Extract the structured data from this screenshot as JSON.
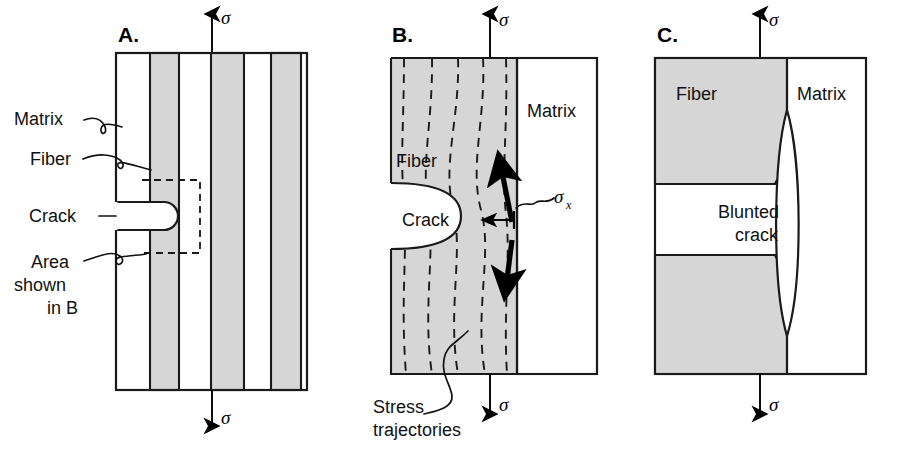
{
  "figure": {
    "background_color": "#ffffff",
    "fiber_color": "#d6d6d6",
    "matrix_color": "#ffffff",
    "line_color": "#1a1a1a"
  },
  "panels": [
    {
      "id": "A",
      "letter": "A.",
      "stress_top_label": "σ",
      "stress_bottom_label": "σ",
      "labels": [
        {
          "key": "matrix",
          "text": "Matrix"
        },
        {
          "key": "fiber",
          "text": "Fiber"
        },
        {
          "key": "crack",
          "text": "Crack"
        },
        {
          "key": "area_line1",
          "text": "Area"
        },
        {
          "key": "area_line2",
          "text": "shown"
        },
        {
          "key": "area_line3",
          "text": "in B"
        }
      ]
    },
    {
      "id": "B",
      "letter": "B.",
      "stress_top_label": "σ",
      "stress_bottom_label": "σ",
      "labels": [
        {
          "key": "matrix",
          "text": "Matrix"
        },
        {
          "key": "fiber",
          "text": "Fiber"
        },
        {
          "key": "crack",
          "text": "Crack"
        },
        {
          "key": "sigma_x",
          "text": "σ"
        },
        {
          "key": "sigma_x_sub",
          "text": "x"
        },
        {
          "key": "stress_line1",
          "text": "Stress"
        },
        {
          "key": "stress_line2",
          "text": "trajectories"
        }
      ]
    },
    {
      "id": "C",
      "letter": "C.",
      "stress_top_label": "σ",
      "stress_bottom_label": "σ",
      "labels": [
        {
          "key": "fiber",
          "text": "Fiber"
        },
        {
          "key": "matrix",
          "text": "Matrix"
        },
        {
          "key": "blunted_line1",
          "text": "Blunted"
        },
        {
          "key": "blunted_line2",
          "text": "crack"
        }
      ]
    }
  ]
}
